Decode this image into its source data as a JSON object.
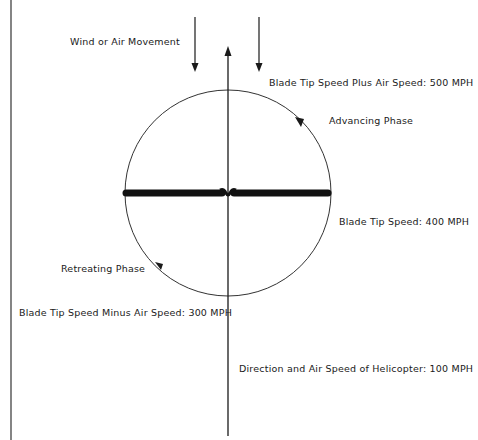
{
  "diagram": {
    "labels": {
      "wind": "Wind or Air Movement",
      "advancing_speed": "Blade Tip Speed Plus Air Speed: 500 MPH",
      "advancing_phase": "Advancing Phase",
      "blade_tip_speed": "Blade Tip Speed: 400 MPH",
      "retreating_phase": "Retreating Phase",
      "retreating_speed": "Blade Tip Speed Minus Air Speed: 300 MPH",
      "helicopter_speed": "Direction and Air Speed of Helicopter: 100 MPH"
    },
    "values": {
      "advancing_mph": 500,
      "blade_tip_mph": 400,
      "retreating_mph": 300,
      "helicopter_mph": 100
    },
    "colors": {
      "line": "#1a1a1a",
      "background": "#ffffff"
    }
  }
}
